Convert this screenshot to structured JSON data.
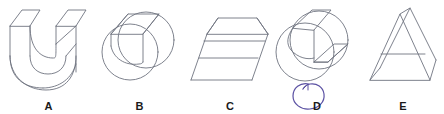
{
  "figure": {
    "name": "multiple-choice-3d-shapes",
    "background_color": "#ffffff",
    "stroke_color": "#6f7480",
    "label_color": "#1a1a1a",
    "annotation_color": "#5b51a3",
    "width": 444,
    "height": 114
  },
  "options": [
    {
      "id": "A",
      "label": "A",
      "shape_name": "u-shaped-channel-block",
      "description": "U-shaped extruded block with semicircular slot, drawn in oblique projection",
      "left": 0,
      "width": 97
    },
    {
      "id": "B",
      "label": "B",
      "shape_name": "notched-cylinder",
      "description": "Cylinder seen end-on with a flat wedge cut across the top front",
      "left": 97,
      "width": 85
    },
    {
      "id": "C",
      "label": "C",
      "shape_name": "trapezoidal-prism",
      "description": "Trapezoidal prism / truncated wedge with visible top face and front step line",
      "left": 185,
      "width": 90
    },
    {
      "id": "D",
      "label": "D",
      "shape_name": "quarter-notched-cylinder",
      "description": "Cylinder with a quarter wedge notch removed from the upper right quadrant",
      "left": 272,
      "width": 90
    },
    {
      "id": "E",
      "label": "E",
      "shape_name": "triangular-prism",
      "description": "Triangular prism standing on its rectangular base with a horizontal edge line",
      "left": 362,
      "width": 82
    }
  ],
  "annotation": {
    "name": "handwritten-selection-circle",
    "target": "D",
    "color": "#5b51a3",
    "style": "hand-drawn oval scribble around the letter D"
  }
}
